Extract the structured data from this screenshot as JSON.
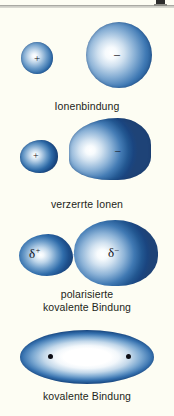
{
  "figure": {
    "background_color": "#fdfdf3",
    "ink_color": "#231f20",
    "blue_dark": "#1d4f8c",
    "blue_mid": "#3f79b4",
    "blue_light": "#cfe0ef",
    "corner_mark": "scan-registration-mark"
  },
  "panels": [
    {
      "id": "ionenbindung",
      "caption": "Ionenbindung",
      "left_particle": {
        "charge_label": "+",
        "shape": "sphere",
        "size": "small"
      },
      "right_particle": {
        "charge_label": "–",
        "shape": "sphere",
        "size": "large"
      }
    },
    {
      "id": "verzerrte-ionen",
      "caption": "verzerrte Ionen",
      "left_particle": {
        "charge_label": "+",
        "shape": "egg",
        "size": "small"
      },
      "right_particle": {
        "charge_label": "–",
        "shape": "teardrop",
        "size": "large"
      }
    },
    {
      "id": "polarisierte-kovalente-bindung",
      "caption_line1": "polarisierte",
      "caption_line2": "kovalente Bindung",
      "left_particle": {
        "charge_symbol": "δ",
        "charge_superscript": "+",
        "shape": "lobe",
        "size": "small"
      },
      "right_particle": {
        "charge_symbol": "δ",
        "charge_superscript": "–",
        "shape": "lobe",
        "size": "large"
      }
    },
    {
      "id": "kovalente-bindung",
      "caption": "kovalente Bindung",
      "shape": "shared-ellipse",
      "nuclei_count": 2
    }
  ]
}
